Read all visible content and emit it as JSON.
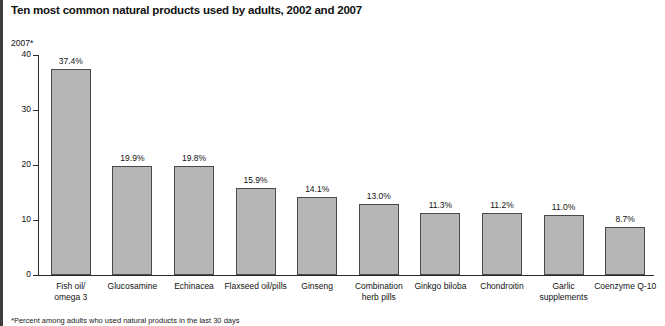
{
  "header": {
    "title": "Ten most common natural products used by adults, 2002 and 2007"
  },
  "axis": {
    "unit_label": "2007*"
  },
  "footnote": {
    "text": "*Percent among adults who used natural products in the last 30 days"
  },
  "colors": {
    "bar_fill": "#b6b6b6",
    "bar_border": "#4a4a4a",
    "axis": "#2b2b2b",
    "text": "#111111",
    "left_rule": "#3d3d3d"
  },
  "chart_data": {
    "type": "bar",
    "title": "Ten most common natural products used by adults, 2002 and 2007",
    "xlabel": "",
    "ylabel": "2007*",
    "ylim": [
      0,
      40
    ],
    "yticks": [
      0,
      10,
      20,
      30,
      40
    ],
    "ytick_labels": [
      "0",
      "10",
      "20",
      "30",
      "40"
    ],
    "grid": false,
    "legend": false,
    "categories": [
      "Fish oil/\nomega 3",
      "Glucosamine",
      "Echinacea",
      "Flaxseed oil/pills",
      "Ginseng",
      "Combination\nherb pills",
      "Ginkgo biloba",
      "Chondroitin",
      "Garlic\nsupplements",
      "Coenzyme Q-10"
    ],
    "values": [
      37.4,
      19.9,
      19.8,
      15.9,
      14.1,
      13.0,
      11.3,
      11.2,
      11.0,
      8.7
    ],
    "data_labels": [
      "37.4%",
      "19.9%",
      "19.8%",
      "15.9%",
      "14.1%",
      "13.0%",
      "11.3%",
      "11.2%",
      "11.0%",
      "8.7%"
    ]
  }
}
